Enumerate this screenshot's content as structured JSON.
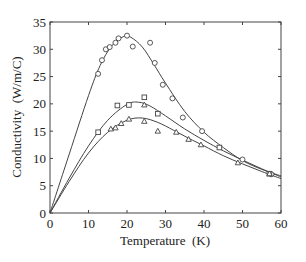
{
  "chart_data": {
    "type": "scatter",
    "title": "",
    "xlabel": "Temperature  (K)",
    "ylabel": "Conductivity  (W/m/C)",
    "xlim": [
      0,
      60
    ],
    "ylim": [
      0,
      35
    ],
    "xticks": [
      0,
      10,
      20,
      30,
      40,
      50,
      60
    ],
    "yticks": [
      0,
      5,
      10,
      15,
      20,
      25,
      30,
      35
    ],
    "grid": false,
    "legend": null,
    "series": [
      {
        "name": "circles",
        "marker": "circle",
        "points": [
          [
            12.5,
            25.5
          ],
          [
            13.5,
            28
          ],
          [
            14.5,
            30
          ],
          [
            15.5,
            30.4
          ],
          [
            17,
            31.2
          ],
          [
            17.8,
            32
          ],
          [
            20,
            32.5
          ],
          [
            21.5,
            30.5
          ],
          [
            26,
            31.2
          ],
          [
            27.2,
            27.5
          ],
          [
            29.3,
            23.5
          ],
          [
            31.8,
            21
          ],
          [
            34.5,
            17.5
          ],
          [
            39.5,
            15
          ],
          [
            50,
            9.8
          ],
          [
            57.5,
            7.1
          ]
        ],
        "fit": [
          [
            0,
            0
          ],
          [
            5,
            10.8
          ],
          [
            10,
            21.5
          ],
          [
            13,
            27
          ],
          [
            16,
            30.6
          ],
          [
            19,
            32.3
          ],
          [
            21,
            32.2
          ],
          [
            24,
            30.4
          ],
          [
            27,
            27.2
          ],
          [
            30,
            23.8
          ],
          [
            35,
            18.6
          ],
          [
            40,
            14.8
          ],
          [
            45,
            12
          ],
          [
            50,
            9.6
          ],
          [
            55,
            8
          ],
          [
            60,
            6.8
          ]
        ]
      },
      {
        "name": "squares",
        "marker": "square",
        "points": [
          [
            12.5,
            14.8
          ],
          [
            17.5,
            19.7
          ],
          [
            20.5,
            19.8
          ],
          [
            24.5,
            21.2
          ],
          [
            28,
            18.2
          ],
          [
            44,
            12
          ],
          [
            57,
            7.2
          ]
        ],
        "fit": [
          [
            0,
            0
          ],
          [
            5,
            6.4
          ],
          [
            10,
            12.3
          ],
          [
            15,
            17
          ],
          [
            20,
            19.9
          ],
          [
            23,
            20.3
          ],
          [
            26,
            19.6
          ],
          [
            30,
            17.8
          ],
          [
            35,
            15.4
          ],
          [
            40,
            13.3
          ],
          [
            45,
            11.4
          ],
          [
            50,
            9.7
          ],
          [
            55,
            8.1
          ],
          [
            60,
            6.6
          ]
        ]
      },
      {
        "name": "triangles",
        "marker": "triangle",
        "points": [
          [
            15.8,
            15.4
          ],
          [
            17,
            15.6
          ],
          [
            18.5,
            16.4
          ],
          [
            20.5,
            17.2
          ],
          [
            24.5,
            16.8
          ],
          [
            24.5,
            19.8
          ],
          [
            28,
            15
          ],
          [
            32.8,
            14.8
          ],
          [
            36,
            13.5
          ],
          [
            39.2,
            12.5
          ],
          [
            48.8,
            9.2
          ],
          [
            57,
            7.2
          ]
        ],
        "fit": [
          [
            0,
            0
          ],
          [
            5,
            5.8
          ],
          [
            10,
            11
          ],
          [
            15,
            14.8
          ],
          [
            20,
            17
          ],
          [
            24,
            17.4
          ],
          [
            28,
            16.6
          ],
          [
            32,
            15.2
          ],
          [
            36,
            13.7
          ],
          [
            40,
            12.3
          ],
          [
            45,
            10.5
          ],
          [
            50,
            9
          ],
          [
            55,
            7.6
          ],
          [
            60,
            6.3
          ]
        ]
      }
    ]
  }
}
